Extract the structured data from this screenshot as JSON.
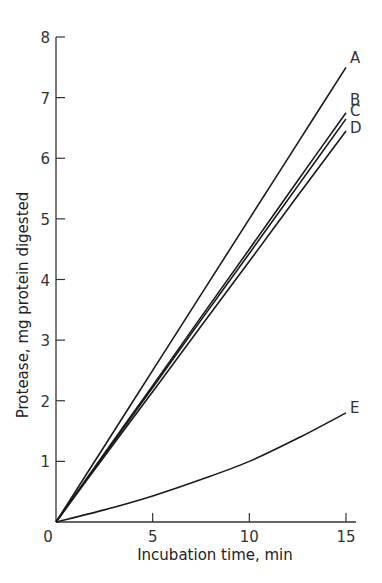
{
  "chart_data": {
    "type": "line",
    "title": "",
    "xlabel": "Incubation time, min",
    "ylabel": "Protease, mg protein digested",
    "xlim": [
      0,
      15
    ],
    "ylim": [
      0,
      8
    ],
    "xticks": [
      0,
      5,
      10,
      15
    ],
    "yticks": [
      1,
      2,
      3,
      4,
      5,
      6,
      7,
      8
    ],
    "origin_label": "0",
    "grid": false,
    "legend": "inline labels at line ends (right)",
    "x": [
      0,
      2.5,
      5,
      7.5,
      10,
      12.5,
      15
    ],
    "series": [
      {
        "name": "A",
        "values": [
          0,
          1.25,
          2.5,
          3.75,
          5.0,
          6.25,
          7.5
        ]
      },
      {
        "name": "B",
        "values": [
          0,
          1.13,
          2.25,
          3.38,
          4.5,
          5.63,
          6.75
        ]
      },
      {
        "name": "C",
        "values": [
          0,
          1.11,
          2.22,
          3.33,
          4.43,
          5.54,
          6.65
        ]
      },
      {
        "name": "D",
        "values": [
          0,
          1.08,
          2.15,
          3.23,
          4.3,
          5.38,
          6.45
        ]
      },
      {
        "name": "E",
        "values": [
          0,
          0.2,
          0.43,
          0.7,
          1.0,
          1.38,
          1.8
        ]
      }
    ]
  },
  "colors": {
    "line": "#1a1a1a",
    "axis": "#333333",
    "background": "#ffffff"
  }
}
